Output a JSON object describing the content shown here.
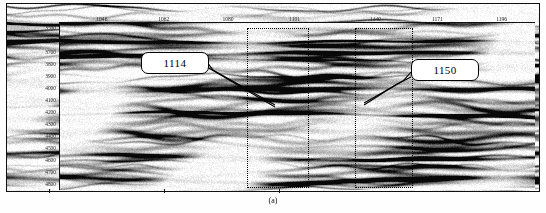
{
  "figure": {
    "title": "102-pstm-in0811 - 1120-final-merged-inline 505",
    "caption": "(a)",
    "type": "seismic-section"
  },
  "chart_data": {
    "type": "heatmap",
    "title": "102-pstm-in0811 - 1120-final-merged-inline 505",
    "xlabel": "",
    "ylabel": "",
    "grid": false,
    "legend": "none",
    "x_axis": {
      "position": "top",
      "name": "crossline",
      "ticks": [
        1046,
        1062,
        1080,
        1101,
        1140,
        1171,
        1196
      ],
      "xlim": [
        1040,
        1200
      ]
    },
    "y_axis": {
      "position": "left",
      "name": "depth",
      "ticks": [
        3500,
        3600,
        3700,
        3800,
        3900,
        4000,
        4100,
        4200,
        4300,
        4400,
        4500,
        4600,
        4700,
        4800
      ],
      "ylim": [
        3460,
        4840
      ],
      "direction": "increasing-downward"
    },
    "annotations": [
      {
        "label": "1114",
        "kind": "callout-box",
        "points_to_x": 1108,
        "points_to_y": 4050
      },
      {
        "label": "1150",
        "kind": "callout-box",
        "points_to_x": 1152,
        "points_to_y": 4080
      },
      {
        "kind": "dotted-zone",
        "x_start": 1096,
        "x_end": 1118,
        "y_start": 3530,
        "y_end": 4820
      },
      {
        "kind": "dotted-zone",
        "x_start": 1142,
        "x_end": 1162,
        "y_start": 3530,
        "y_end": 4820
      }
    ]
  },
  "top_ticks": [
    {
      "label": "1046",
      "pos_pct": 9.0
    },
    {
      "label": "1062",
      "pos_pct": 22.0
    },
    {
      "label": "1080",
      "pos_pct": 35.5
    },
    {
      "label": "1101",
      "pos_pct": 49.5
    },
    {
      "label": "1140",
      "pos_pct": 66.5
    },
    {
      "label": "1171",
      "pos_pct": 79.5
    },
    {
      "label": "1196",
      "pos_pct": 93.0
    }
  ],
  "depth_labels": [
    "3500",
    "3600",
    "3700",
    "3800",
    "3900",
    "4000",
    "4100",
    "4200",
    "4300",
    "4400",
    "4500",
    "4600",
    "4700",
    "4800"
  ],
  "callouts": [
    {
      "label": "1114"
    },
    {
      "label": "1150"
    }
  ],
  "colors": {
    "ink": "#101010",
    "background": "#ffffff",
    "annotation": "#000000"
  }
}
